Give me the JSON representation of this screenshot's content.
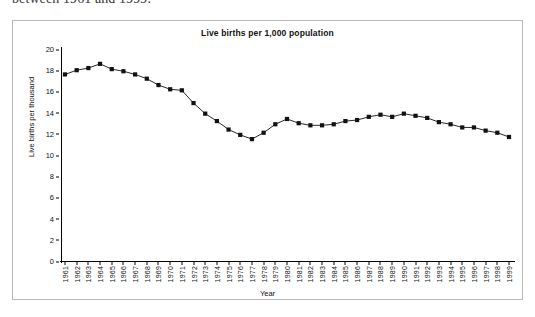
{
  "intro_text": "between 1961 and 1999.",
  "axis": {
    "y_label": "Live births per thousand",
    "x_label": "Year",
    "y_ticks": [
      0,
      2,
      4,
      6,
      8,
      10,
      12,
      14,
      16,
      18,
      20
    ]
  },
  "chart_data": {
    "type": "line",
    "title": "Live births per 1,000 population",
    "xlabel": "Year",
    "ylabel": "Live births per thousand",
    "ylim": [
      0,
      20
    ],
    "xlim": [
      1961,
      1999
    ],
    "grid": false,
    "legend": null,
    "marker": "filled-square",
    "line_color": "#111111",
    "marker_color": "#111111",
    "categories": [
      "1961",
      "1962",
      "1963",
      "1964",
      "1965",
      "1966",
      "1967",
      "1968",
      "1969",
      "1970",
      "1971",
      "1972",
      "1973",
      "1974",
      "1975",
      "1976",
      "1977",
      "1978",
      "1979",
      "1980",
      "1981",
      "1982",
      "1983",
      "1984",
      "1985",
      "1986",
      "1987",
      "1988",
      "1989",
      "1990",
      "1991",
      "1992",
      "1993",
      "1994",
      "1995",
      "1996",
      "1997",
      "1998",
      "1999"
    ],
    "values": [
      17.6,
      18.0,
      18.2,
      18.6,
      18.1,
      17.9,
      17.6,
      17.2,
      16.6,
      16.2,
      16.1,
      14.9,
      13.9,
      13.2,
      12.4,
      11.9,
      11.5,
      12.1,
      12.9,
      13.4,
      13.0,
      12.8,
      12.8,
      12.9,
      13.2,
      13.3,
      13.6,
      13.8,
      13.6,
      13.9,
      13.7,
      13.5,
      13.1,
      12.9,
      12.6,
      12.6,
      12.3,
      12.1,
      11.7
    ],
    "series_name": "Live births per 1,000 population"
  }
}
